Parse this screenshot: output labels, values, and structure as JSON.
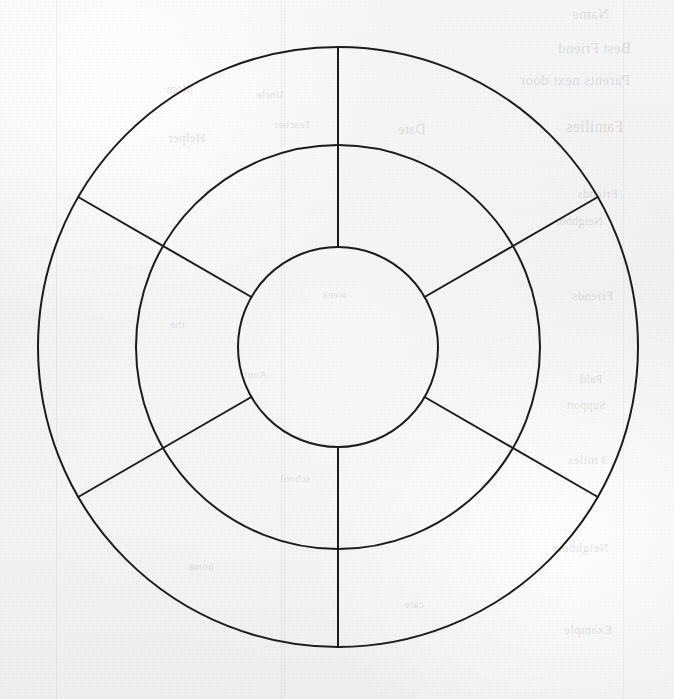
{
  "page": {
    "kind": "scanned-worksheet",
    "width": 674,
    "height": 699,
    "paper_color": "#f3f3f4",
    "ink_color": "#1c1c1c"
  },
  "diagram": {
    "title": "",
    "type": "concentric-circles-segmented",
    "center": {
      "x": 338,
      "y": 347
    },
    "rings": [
      {
        "name": "outer-ring",
        "radius": 300
      },
      {
        "name": "middle-ring",
        "radius": 202
      },
      {
        "name": "inner-circle",
        "radius": 100
      }
    ],
    "spoke_angles_deg": [
      90,
      30,
      330,
      270,
      210,
      150
    ],
    "stroke_width": 2,
    "center_label": "",
    "outer_sector_labels": [
      "",
      "",
      "",
      "",
      "",
      ""
    ],
    "middle_sector_labels": [
      "",
      "",
      "",
      "",
      "",
      ""
    ]
  },
  "fold_lines_x": [
    56,
    281,
    284,
    623
  ],
  "bleed_through_text": [
    {
      "text": "Name",
      "x": 572,
      "y": 6,
      "size": 15,
      "rule": false
    },
    {
      "text": "Best Friend",
      "x": 558,
      "y": 40,
      "size": 15,
      "rule": false
    },
    {
      "text": "Parents next door",
      "x": 520,
      "y": 72,
      "size": 15,
      "rule": false
    },
    {
      "text": "Families",
      "x": 566,
      "y": 118,
      "size": 16,
      "rule": false
    },
    {
      "text": "Date",
      "x": 398,
      "y": 122,
      "size": 14,
      "rule": false
    },
    {
      "text": "Helper",
      "x": 168,
      "y": 130,
      "size": 13,
      "rule": false
    },
    {
      "text": "Mom",
      "x": 166,
      "y": 82,
      "size": 12,
      "rule": false
    },
    {
      "text": "Uncle",
      "x": 256,
      "y": 88,
      "size": 11,
      "rule": false
    },
    {
      "text": "Teacher",
      "x": 274,
      "y": 118,
      "size": 11,
      "rule": false
    },
    {
      "text": "Friends",
      "x": 577,
      "y": 186,
      "size": 13,
      "rule": false
    },
    {
      "text": "Neighbor",
      "x": 555,
      "y": 214,
      "size": 12,
      "rule": false
    },
    {
      "text": "Friends",
      "x": 572,
      "y": 288,
      "size": 13,
      "rule": false
    },
    {
      "text": "Paid",
      "x": 580,
      "y": 372,
      "size": 12,
      "rule": false
    },
    {
      "text": "Support",
      "x": 566,
      "y": 398,
      "size": 12,
      "rule": false
    },
    {
      "text": "3 miles",
      "x": 568,
      "y": 452,
      "size": 13,
      "rule": false
    },
    {
      "text": "Neighbors",
      "x": 552,
      "y": 540,
      "size": 13,
      "rule": false
    },
    {
      "text": "Example",
      "x": 564,
      "y": 622,
      "size": 13,
      "rule": false
    },
    {
      "text": "the",
      "x": 170,
      "y": 318,
      "size": 11,
      "rule": false
    },
    {
      "text": "week",
      "x": 322,
      "y": 288,
      "size": 11,
      "rule": false
    },
    {
      "text": "Aunt",
      "x": 244,
      "y": 368,
      "size": 11,
      "rule": false
    },
    {
      "text": "school",
      "x": 280,
      "y": 472,
      "size": 11,
      "rule": false
    },
    {
      "text": "home",
      "x": 188,
      "y": 560,
      "size": 11,
      "rule": false
    },
    {
      "text": "care",
      "x": 404,
      "y": 598,
      "size": 11,
      "rule": false
    }
  ]
}
